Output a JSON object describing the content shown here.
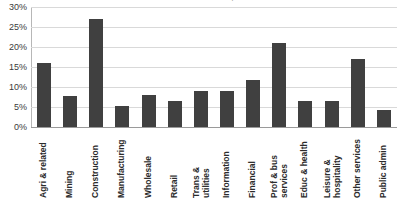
{
  "chart_data": {
    "type": "bar",
    "title": "Share of businesses, 2015",
    "xlabel": "",
    "ylabel": "",
    "ylim": [
      0,
      30
    ],
    "ytick_labels": [
      "30%",
      "25%",
      "20%",
      "15%",
      "10%",
      "5%",
      "0%"
    ],
    "ytick_values": [
      30,
      25,
      20,
      15,
      10,
      5,
      0
    ],
    "grid": true,
    "legend": false,
    "bar_color": "#404040",
    "gridline_color": "#d9d9d9",
    "categories": [
      "Agri & related",
      "Mining",
      "Construction",
      "Manufacturing",
      "Wholesale",
      "Retail",
      "Trans &\nutilities",
      "Information",
      "Financial",
      "Prof & bus\nservices",
      "Educ & health",
      "Leisure &\nhospitality",
      "Other services",
      "Public admin"
    ],
    "values": [
      16.1,
      7.8,
      27.0,
      5.3,
      8.0,
      6.4,
      9.1,
      9.1,
      11.8,
      21.1,
      6.4,
      6.6,
      17.1,
      4.2
    ]
  }
}
